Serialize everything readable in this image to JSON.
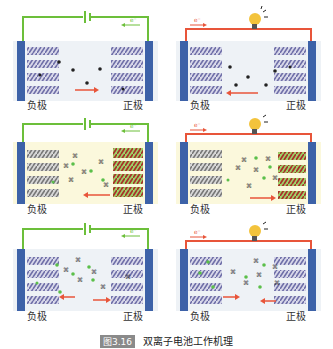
{
  "figure": {
    "caption_tag": "图3.16",
    "caption_text": "双离子电池工作机理"
  },
  "colors": {
    "charge_wire": "#6cbf3a",
    "discharge_wire": "#e8553a",
    "electrode": "#3d62a8",
    "electrolyte_fill": "#fbf8dc",
    "ion_arrow": "#e8553a",
    "graphite": "#7f7fb3",
    "bulb": "#f3c33c"
  },
  "panels": [
    {
      "id": "row1-charge",
      "mode": "charge",
      "electron_label": "e⁻",
      "negative_label": "负极",
      "positive_label": "正极",
      "source": "battery"
    },
    {
      "id": "row1-discharge",
      "mode": "discharge",
      "electron_label": "e⁻",
      "negative_label": "负极",
      "positive_label": "正极",
      "source": "bulb"
    },
    {
      "id": "row2-charge",
      "mode": "charge",
      "electron_label": "e⁻",
      "negative_label": "负极",
      "positive_label": "正极",
      "source": "battery"
    },
    {
      "id": "row2-discharge",
      "mode": "discharge",
      "electron_label": "e⁻",
      "negative_label": "负极",
      "positive_label": "正极",
      "source": "bulb"
    },
    {
      "id": "row3-charge",
      "mode": "charge",
      "electron_label": "e⁻",
      "negative_label": "负极",
      "positive_label": "正极",
      "source": "battery"
    },
    {
      "id": "row3-discharge",
      "mode": "discharge",
      "electron_label": "e⁻",
      "negative_label": "负极",
      "positive_label": "正极",
      "source": "bulb"
    }
  ]
}
